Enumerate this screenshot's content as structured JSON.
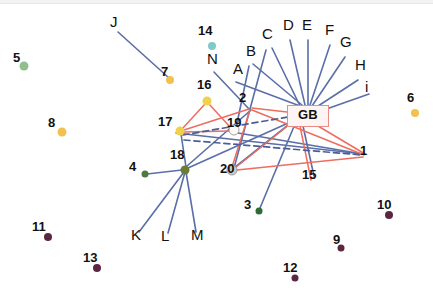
{
  "figure": {
    "type": "network-graph",
    "width": 433,
    "height": 302,
    "background": "#ffffff"
  },
  "colors": {
    "edge_blue": "#5a6ea8",
    "edge_red": "#ed6d5f",
    "edge_dashed": "#4b5e97",
    "node_green": "#5e8a4f",
    "node_green_dark": "#2f6b35",
    "node_green_light": "#8fbf8a",
    "node_yellow": "#f0d14b",
    "node_gold": "#f2c14e",
    "node_teal": "#7fc9c9",
    "node_purple": "#5b2740",
    "node_gray": "#c9c9c9",
    "node_white": "#ffffff",
    "gb_border": "#e98b86",
    "gb_fill": "#fdf4f3",
    "text": "#111111"
  },
  "center_node": {
    "label": "GB",
    "x": 307,
    "y": 115,
    "box_w": 40,
    "box_h": 20
  },
  "nodes": [
    {
      "id": "1",
      "label": "1",
      "x": 366,
      "y": 157,
      "color": "#5b2740",
      "r": 0,
      "label_dx": 0,
      "label_dy": -1,
      "shown": true
    },
    {
      "id": "3",
      "label": "3",
      "x": 259,
      "y": 211,
      "color": "#2f6b35",
      "r": 3.5,
      "label_dx": -9,
      "label_dy": -1,
      "shown": true
    },
    {
      "id": "4",
      "label": "4",
      "x": 145,
      "y": 174,
      "color": "#4f7a3f",
      "r": 3.5,
      "label_dx": -10,
      "label_dy": -2,
      "shown": true
    },
    {
      "id": "5",
      "label": "5",
      "x": 24,
      "y": 66,
      "color": "#8fbf8a",
      "r": 4.5,
      "label_dx": -5,
      "label_dy": -3,
      "shown": true
    },
    {
      "id": "6",
      "label": "6",
      "x": 415,
      "y": 113,
      "color": "#f2c14e",
      "r": 4,
      "label_dx": -2,
      "label_dy": -10,
      "shown": true
    },
    {
      "id": "7",
      "label": "7",
      "x": 170,
      "y": 80,
      "color": "#f2c14e",
      "r": 4,
      "label_dx": -3,
      "label_dy": -3,
      "shown": true
    },
    {
      "id": "8",
      "label": "8",
      "x": 62,
      "y": 132,
      "color": "#f2c14e",
      "r": 4.5,
      "label_dx": -8,
      "label_dy": -4,
      "shown": true
    },
    {
      "id": "9",
      "label": "9",
      "x": 341,
      "y": 248,
      "color": "#5b2740",
      "r": 3.5,
      "label_dx": -2,
      "label_dy": -3,
      "shown": true
    },
    {
      "id": "10",
      "label": "10",
      "x": 389,
      "y": 215,
      "color": "#5b2740",
      "r": 4,
      "label_dx": -6,
      "label_dy": -5,
      "shown": true
    },
    {
      "id": "11",
      "label": "11",
      "x": 48,
      "y": 237,
      "color": "#5b2740",
      "r": 4,
      "label_dx": -10,
      "label_dy": -5,
      "shown": true
    },
    {
      "id": "12",
      "label": "12",
      "x": 295,
      "y": 278,
      "color": "#5b2740",
      "r": 3.5,
      "label_dx": -6,
      "label_dy": -5,
      "shown": true
    },
    {
      "id": "13",
      "label": "13",
      "x": 97,
      "y": 268,
      "color": "#5b2740",
      "r": 4,
      "label_dx": -8,
      "label_dy": -5,
      "shown": true
    },
    {
      "id": "14",
      "label": "14",
      "x": 212,
      "y": 46,
      "color": "#7fc9c9",
      "r": 4,
      "label_dx": -8,
      "label_dy": -10,
      "shown": true
    },
    {
      "id": "15",
      "label": "15",
      "x": 314,
      "y": 184,
      "color": "#5b2740",
      "r": 0,
      "label_dx": -6,
      "label_dy": -4,
      "shown": true
    },
    {
      "id": "16",
      "label": "16",
      "x": 207,
      "y": 101,
      "color": "#f0d14b",
      "r": 4.5,
      "label_dx": -4,
      "label_dy": -11,
      "shown": true
    },
    {
      "id": "17",
      "label": "17",
      "x": 180,
      "y": 131,
      "color": "#f0d14b",
      "r": 4.5,
      "label_dx": -16,
      "label_dy": -4,
      "shown": true
    },
    {
      "id": "18",
      "label": "18",
      "x": 185,
      "y": 170,
      "color": "#6b7a35",
      "r": 4.5,
      "label_dx": -9,
      "label_dy": -10,
      "shown": true
    },
    {
      "id": "19",
      "label": "19",
      "x": 234,
      "y": 130,
      "color": "#fbfbfb",
      "r": 5,
      "label_dx": -1,
      "label_dy": -2,
      "shown": true
    },
    {
      "id": "20",
      "label": "20",
      "x": 232,
      "y": 170,
      "color": "#cccccc",
      "r": 5,
      "label_dx": -6,
      "label_dy": 4,
      "shown": true
    },
    {
      "id": "2",
      "label": "2",
      "x": 249,
      "y": 106,
      "color": "#5b2740",
      "r": 0,
      "label_dx": -4,
      "label_dy": -3,
      "shown": true
    }
  ],
  "alpha_labels": [
    {
      "id": "A",
      "label": "A",
      "x": 238,
      "y": 74
    },
    {
      "id": "B",
      "label": "B",
      "x": 251,
      "y": 56
    },
    {
      "id": "C",
      "label": "C",
      "x": 267,
      "y": 39
    },
    {
      "id": "D",
      "label": "D",
      "x": 288,
      "y": 30
    },
    {
      "id": "E",
      "label": "E",
      "x": 307,
      "y": 30
    },
    {
      "id": "F",
      "label": "F",
      "x": 330,
      "y": 35
    },
    {
      "id": "G",
      "label": "G",
      "x": 345,
      "y": 47
    },
    {
      "id": "H",
      "label": "H",
      "x": 360,
      "y": 70
    },
    {
      "id": "i",
      "label": "i",
      "x": 370,
      "y": 92
    },
    {
      "id": "J",
      "label": "J",
      "x": 115,
      "y": 27
    },
    {
      "id": "K",
      "label": "K",
      "x": 136,
      "y": 240
    },
    {
      "id": "L",
      "label": "L",
      "x": 166,
      "y": 241
    },
    {
      "id": "M",
      "label": "M",
      "x": 196,
      "y": 240
    },
    {
      "id": "N",
      "label": "N",
      "x": 212,
      "y": 64
    }
  ],
  "edges_blue": [
    {
      "from": "GB",
      "to": "A",
      "x1": 300,
      "y1": 106,
      "x2": 236,
      "y2": 82
    },
    {
      "from": "GB",
      "to": "B",
      "x1": 302,
      "y1": 105,
      "x2": 253,
      "y2": 64
    },
    {
      "from": "GB",
      "to": "C",
      "x1": 300,
      "y1": 106,
      "x2": 272,
      "y2": 48
    },
    {
      "from": "GB",
      "to": "D",
      "x1": 305,
      "y1": 105,
      "x2": 290,
      "y2": 40
    },
    {
      "from": "GB",
      "to": "E",
      "x1": 308,
      "y1": 105,
      "x2": 308,
      "y2": 40
    },
    {
      "from": "GB",
      "to": "F",
      "x1": 310,
      "y1": 105,
      "x2": 330,
      "y2": 45
    },
    {
      "from": "GB",
      "to": "G",
      "x1": 312,
      "y1": 106,
      "x2": 345,
      "y2": 57
    },
    {
      "from": "GB",
      "to": "H",
      "x1": 315,
      "y1": 108,
      "x2": 358,
      "y2": 80
    },
    {
      "from": "GB",
      "to": "i",
      "x1": 318,
      "y1": 112,
      "x2": 369,
      "y2": 94
    },
    {
      "from": "B",
      "to": "19",
      "x1": 249,
      "y1": 66,
      "x2": 236,
      "y2": 128
    },
    {
      "from": "C",
      "to": "20",
      "x1": 266,
      "y1": 50,
      "x2": 234,
      "y2": 168
    },
    {
      "from": "N",
      "to": "2",
      "x1": 214,
      "y1": 72,
      "x2": 250,
      "y2": 110
    },
    {
      "from": "J",
      "to": "7",
      "x1": 118,
      "y1": 32,
      "x2": 169,
      "y2": 78
    },
    {
      "from": "18",
      "to": "K",
      "x1": 184,
      "y1": 172,
      "x2": 139,
      "y2": 232
    },
    {
      "from": "18",
      "to": "L",
      "x1": 185,
      "y1": 172,
      "x2": 168,
      "y2": 233
    },
    {
      "from": "18",
      "to": "M",
      "x1": 186,
      "y1": 172,
      "x2": 196,
      "y2": 232
    },
    {
      "from": "18",
      "to": "4",
      "x1": 182,
      "y1": 170,
      "x2": 147,
      "y2": 174
    },
    {
      "from": "18",
      "to": "GB",
      "x1": 188,
      "y1": 168,
      "x2": 295,
      "y2": 120
    },
    {
      "from": "18",
      "to": "2",
      "x1": 187,
      "y1": 166,
      "x2": 251,
      "y2": 110
    },
    {
      "from": "17",
      "to": "18",
      "x1": 181,
      "y1": 134,
      "x2": 186,
      "y2": 167
    },
    {
      "from": "GB",
      "to": "3",
      "x1": 295,
      "y1": 124,
      "x2": 260,
      "y2": 208
    },
    {
      "from": "GB",
      "to": "15",
      "x1": 303,
      "y1": 126,
      "x2": 314,
      "y2": 176
    },
    {
      "from": "1",
      "to": "17",
      "x1": 363,
      "y1": 154,
      "x2": 176,
      "y2": 133
    },
    {
      "from": "19",
      "to": "1",
      "x1": 238,
      "y1": 133,
      "x2": 363,
      "y2": 154
    },
    {
      "from": "GB",
      "to": "20",
      "x1": 292,
      "y1": 122,
      "x2": 234,
      "y2": 168
    }
  ],
  "edges_red": [
    {
      "from": "16",
      "to": "17",
      "x1": 205,
      "y1": 104,
      "x2": 182,
      "y2": 129
    },
    {
      "from": "16",
      "to": "19",
      "x1": 209,
      "y1": 104,
      "x2": 231,
      "y2": 128
    },
    {
      "from": "17",
      "to": "19",
      "x1": 184,
      "y1": 132,
      "x2": 229,
      "y2": 131
    },
    {
      "from": "2",
      "to": "GB",
      "x1": 252,
      "y1": 108,
      "x2": 287,
      "y2": 112
    },
    {
      "from": "2",
      "to": "20",
      "x1": 250,
      "y1": 110,
      "x2": 232,
      "y2": 167
    },
    {
      "from": "2",
      "to": "1",
      "x1": 252,
      "y1": 110,
      "x2": 364,
      "y2": 155
    },
    {
      "from": "20",
      "to": "GB",
      "x1": 235,
      "y1": 168,
      "x2": 290,
      "y2": 124
    },
    {
      "from": "20",
      "to": "1",
      "x1": 237,
      "y1": 170,
      "x2": 363,
      "y2": 157
    },
    {
      "from": "GB",
      "to": "1",
      "x1": 318,
      "y1": 126,
      "x2": 365,
      "y2": 154
    },
    {
      "from": "GB",
      "to": "15",
      "x1": 300,
      "y1": 126,
      "x2": 311,
      "y2": 180
    },
    {
      "from": "17",
      "to": "2",
      "x1": 184,
      "y1": 130,
      "x2": 249,
      "y2": 109
    }
  ],
  "edges_dashed": [
    {
      "from": "17",
      "to": "GB",
      "x1": 183,
      "y1": 135,
      "x2": 288,
      "y2": 117
    },
    {
      "from": "17",
      "to": "1",
      "x1": 184,
      "y1": 140,
      "x2": 362,
      "y2": 155
    }
  ]
}
